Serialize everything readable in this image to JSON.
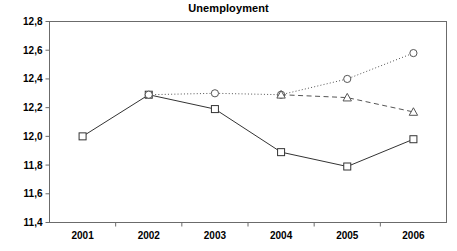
{
  "chart_data": {
    "type": "line",
    "title": "Unemployment",
    "xlabel": "",
    "ylabel": "",
    "categories": [
      "2001",
      "2002",
      "2003",
      "2004",
      "2005",
      "2006"
    ],
    "ylim": [
      11.4,
      12.8
    ],
    "yticks": [
      "11,4",
      "11,6",
      "11,8",
      "12,0",
      "12,2",
      "12,4",
      "12,6",
      "12,8"
    ],
    "ytick_values": [
      11.4,
      11.6,
      11.8,
      12.0,
      12.2,
      12.4,
      12.6,
      12.8
    ],
    "grid": false,
    "legend": "none",
    "decimal_separator": ",",
    "series": [
      {
        "name": "actual",
        "marker": "square",
        "linestyle": "solid",
        "color": "#333333",
        "x": [
          "2001",
          "2002",
          "2003",
          "2004",
          "2005",
          "2006"
        ],
        "values": [
          12.0,
          12.29,
          12.19,
          11.89,
          11.79,
          11.98
        ]
      },
      {
        "name": "projection-dotted",
        "marker": "circle",
        "linestyle": "dotted",
        "color": "#555555",
        "x": [
          "2002",
          "2003",
          "2004",
          "2005",
          "2006"
        ],
        "values": [
          12.29,
          12.3,
          12.29,
          12.4,
          12.58
        ]
      },
      {
        "name": "projection-dashed",
        "marker": "triangle",
        "linestyle": "dashed",
        "color": "#555555",
        "x": [
          "2004",
          "2005",
          "2006"
        ],
        "values": [
          12.29,
          12.27,
          12.17
        ]
      }
    ]
  }
}
